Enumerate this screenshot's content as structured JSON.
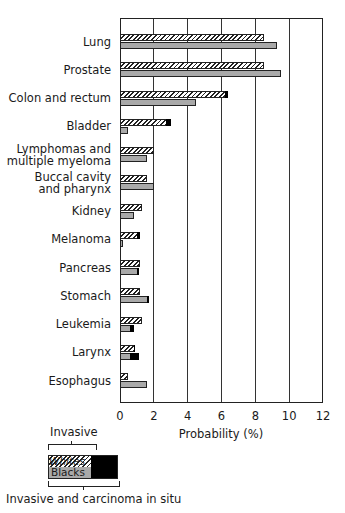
{
  "chart_data": {
    "type": "bar",
    "orientation": "horizontal",
    "title": "",
    "xlabel": "Probability (%)",
    "ylabel": "",
    "xlim": [
      0,
      12
    ],
    "x_ticks": [
      0,
      2,
      4,
      6,
      8,
      10,
      12
    ],
    "grid": "vertical lines at each tick",
    "categories": [
      "Lung",
      "Prostate",
      "Colon and rectum",
      "Bladder",
      "Lymphomas and multiple myeloma",
      "Buccal cavity and pharynx",
      "Kidney",
      "Melanoma",
      "Pancreas",
      "Stomach",
      "Leukemia",
      "Larynx",
      "Esophagus"
    ],
    "category_lines": [
      [
        "Lung"
      ],
      [
        "Prostate"
      ],
      [
        "Colon and rectum"
      ],
      [
        "Bladder"
      ],
      [
        "Lymphomas and",
        "multiple myeloma"
      ],
      [
        "Buccal cavity",
        "and pharynx"
      ],
      [
        "Kidney"
      ],
      [
        "Melanoma"
      ],
      [
        "Pancreas"
      ],
      [
        "Stomach"
      ],
      [
        "Leukemia"
      ],
      [
        "Larynx"
      ],
      [
        "Esophagus"
      ]
    ],
    "series": [
      {
        "name": "Whites",
        "style": "hatched",
        "invasive": [
          8.5,
          8.5,
          6.2,
          2.7,
          2.0,
          1.6,
          1.3,
          1.0,
          1.2,
          1.2,
          1.3,
          0.8,
          0.5
        ],
        "invasive_and_in_situ": [
          8.5,
          8.5,
          6.4,
          3.0,
          2.0,
          1.6,
          1.3,
          1.2,
          1.2,
          1.2,
          1.3,
          0.9,
          0.5
        ]
      },
      {
        "name": "Blacks",
        "style": "gray",
        "invasive": [
          9.3,
          9.5,
          4.5,
          0.5,
          1.6,
          2.0,
          0.8,
          0.2,
          1.0,
          1.6,
          0.6,
          0.6,
          1.6
        ],
        "invasive_and_in_situ": [
          9.3,
          9.5,
          4.5,
          0.5,
          1.6,
          2.0,
          0.8,
          0.2,
          1.1,
          1.7,
          0.8,
          1.1,
          1.6
        ]
      }
    ],
    "legend": {
      "position": "bottom-left",
      "entries": [
        "Whites",
        "Blacks"
      ],
      "invasive_label": "Invasive",
      "in_situ_label": "Invasive and carcinoma in situ"
    }
  }
}
